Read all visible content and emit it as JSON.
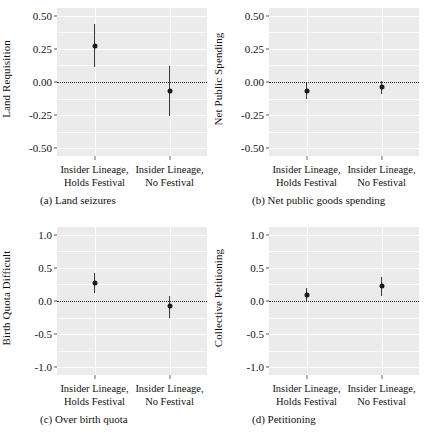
{
  "figure": {
    "panels": [
      "a",
      "b",
      "c",
      "d"
    ]
  },
  "chart_data": [
    {
      "type": "scatter",
      "panel": "a",
      "title": "(a) Land seizures",
      "ylabel": "Land Requisition",
      "xlabel": "",
      "categories": [
        "Insider Lineage, Holds Festival",
        "Insider Lineage, No Festival"
      ],
      "category_lines": [
        [
          "Insider Lineage,",
          "Holds Festival"
        ],
        [
          "Insider Lineage,",
          "No Festival"
        ]
      ],
      "values": [
        0.27,
        -0.07
      ],
      "ci_low": [
        0.11,
        -0.26
      ],
      "ci_high": [
        0.44,
        0.12
      ],
      "yticks": [
        0.5,
        0.25,
        0.0,
        -0.25,
        -0.5
      ],
      "ytick_labels": [
        "0.50",
        "0.25",
        "0.00",
        "-0.25",
        "-0.50"
      ],
      "ylim": [
        -0.56,
        0.56
      ],
      "reference_line": 0.0,
      "grid": true,
      "legend": "none"
    },
    {
      "type": "scatter",
      "panel": "b",
      "title": "(b) Net public goods spending",
      "ylabel": "Net Public Spending",
      "xlabel": "",
      "categories": [
        "Insider Lineage, Holds Festival",
        "Insider Lineage, No Festival"
      ],
      "category_lines": [
        [
          "Insider Lineage,",
          "Holds Festival"
        ],
        [
          "Insider Lineage,",
          "No Festival"
        ]
      ],
      "values": [
        -0.07,
        -0.04
      ],
      "ci_low": [
        -0.13,
        -0.09
      ],
      "ci_high": [
        -0.01,
        0.01
      ],
      "yticks": [
        0.5,
        0.25,
        0.0,
        -0.25,
        -0.5
      ],
      "ytick_labels": [
        "0.50",
        "0.25",
        "0.00",
        "-0.25",
        "-0.50"
      ],
      "ylim": [
        -0.56,
        0.56
      ],
      "reference_line": 0.0,
      "grid": true,
      "legend": "none"
    },
    {
      "type": "scatter",
      "panel": "c",
      "title": "(c) Over birth quota",
      "ylabel": "Birth Quota Difficult",
      "xlabel": "",
      "categories": [
        "Insider Lineage, Holds Festival",
        "Insider Lineage, No Festival"
      ],
      "category_lines": [
        [
          "Insider Lineage,",
          "Holds Festival"
        ],
        [
          "Insider Lineage,",
          "No Festival"
        ]
      ],
      "values": [
        0.27,
        -0.08
      ],
      "ci_low": [
        0.12,
        -0.25
      ],
      "ci_high": [
        0.42,
        0.08
      ],
      "yticks": [
        1.0,
        0.5,
        0.0,
        -0.5,
        -1.0
      ],
      "ytick_labels": [
        "1.0",
        "0.5",
        "0.0",
        "-0.5",
        "-1.0"
      ],
      "ylim": [
        -1.12,
        1.12
      ],
      "reference_line": 0.0,
      "grid": true,
      "legend": "none"
    },
    {
      "type": "scatter",
      "panel": "d",
      "title": "(d) Petitioning",
      "ylabel": "Collective Petitioning",
      "xlabel": "",
      "categories": [
        "Insider Lineage, Holds Festival",
        "Insider Lineage, No Festival"
      ],
      "category_lines": [
        [
          "Insider Lineage,",
          "Holds Festival"
        ],
        [
          "Insider Lineage,",
          "No Festival"
        ]
      ],
      "values": [
        0.09,
        0.22
      ],
      "ci_low": [
        -0.02,
        0.08
      ],
      "ci_high": [
        0.2,
        0.37
      ],
      "yticks": [
        1.0,
        0.5,
        0.0,
        -0.5,
        -1.0
      ],
      "ytick_labels": [
        "1.0",
        "0.5",
        "0.0",
        "-0.5",
        "-1.0"
      ],
      "ylim": [
        -1.12,
        1.12
      ],
      "reference_line": 0.0,
      "grid": true,
      "legend": "none"
    }
  ],
  "style": {
    "panel_background": "#ebebeb",
    "gridline_color": "#ffffff",
    "marker_color": "#1a1a1a",
    "text_color": "#111111"
  }
}
